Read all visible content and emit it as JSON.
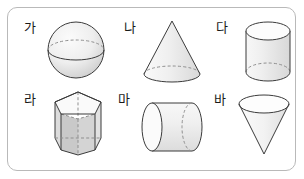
{
  "panel": {
    "name": "solid-figures-panel",
    "border_color": "#b9b9b9",
    "background_color": "#ffffff"
  },
  "figures": [
    {
      "label": "가",
      "shape_name": "sphere",
      "shape_description": "sphere with dashed back equator and solid front equator",
      "row": 1,
      "column": 1
    },
    {
      "label": "나",
      "shape_name": "cone",
      "shape_description": "upright cone with dashed hidden base arc",
      "row": 1,
      "column": 2
    },
    {
      "label": "다",
      "shape_name": "cylinder-vertical",
      "shape_description": "upright cylinder with dashed hidden base arc",
      "row": 1,
      "column": 3
    },
    {
      "label": "라",
      "shape_name": "pentagonal-prism",
      "shape_description": "pentagonal prism with dashed hidden edges",
      "row": 2,
      "column": 1
    },
    {
      "label": "마",
      "shape_name": "cylinder-horizontal",
      "shape_description": "cylinder lying on its side with dashed hidden end arc",
      "row": 2,
      "column": 2
    },
    {
      "label": "바",
      "shape_name": "cone-inverted",
      "shape_description": "inverted cone pointing downward with open elliptical top",
      "row": 2,
      "column": 3
    }
  ],
  "style": {
    "outline_color": "#3b3b3b",
    "fill_light": "#f2f2f2",
    "fill_mid": "#e2e2e2",
    "fill_dark": "#cfcfcf",
    "hidden_edge_color": "#8f8f8f"
  }
}
